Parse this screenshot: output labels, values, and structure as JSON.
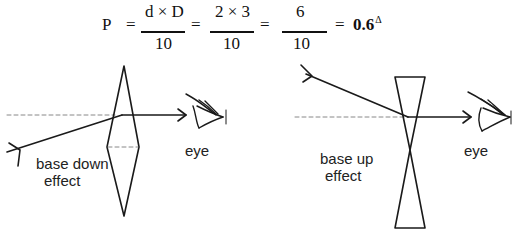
{
  "formula": {
    "lhs": "P",
    "equals": "=",
    "fractions": [
      {
        "numerator": "d × D",
        "denominator": "10"
      },
      {
        "numerator": "2 × 3",
        "denominator": "10"
      },
      {
        "numerator": "6",
        "denominator": "10"
      }
    ],
    "result": "0.6",
    "result_unit": "Δ"
  },
  "left_diagram": {
    "prism_type": "converging (base-to-base)",
    "effect_label_line1": "base down",
    "effect_label_line2": "effect",
    "eye_label": "eye"
  },
  "right_diagram": {
    "prism_type": "diverging (apex-to-apex)",
    "effect_label_line1": "base up",
    "effect_label_line2": "effect",
    "eye_label": "eye"
  },
  "colors": {
    "line": "#1a1a1a",
    "dashed": "#888888",
    "background": "#ffffff"
  }
}
